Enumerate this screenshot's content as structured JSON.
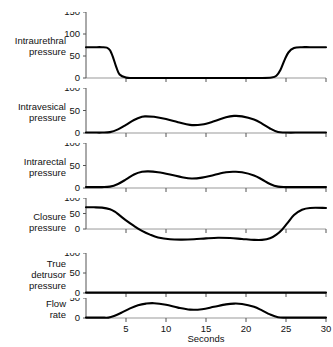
{
  "chart_data": {
    "type": "line",
    "title": "",
    "xlabel": "Seconds",
    "xlim": [
      0,
      30
    ],
    "xticks": [
      5,
      10,
      15,
      20,
      25,
      30
    ],
    "xticklabels": [
      "5",
      "10",
      "15",
      "20",
      "25",
      "30"
    ],
    "grid": false,
    "legend": "none",
    "line_color": "#000000",
    "axis_color": "#999999",
    "panels": [
      {
        "label": "Intraurethral pressure",
        "label_lines": [
          "Intraurethral",
          "pressure"
        ],
        "ylim": [
          0,
          150
        ],
        "yticks": [
          0,
          50,
          100,
          150
        ],
        "yticklabels": [
          "0",
          "50",
          "100",
          "150"
        ],
        "x": [
          0,
          1,
          2,
          2.6,
          3.0,
          3.4,
          3.8,
          4.2,
          5,
          6,
          10,
          14,
          18,
          22,
          23.2,
          23.8,
          24.3,
          24.8,
          25.3,
          26,
          27,
          28,
          30
        ],
        "y": [
          70,
          70,
          70,
          69,
          63,
          46,
          24,
          8,
          1,
          0,
          0,
          0,
          0,
          0,
          1,
          5,
          18,
          40,
          58,
          68,
          70,
          70,
          70
        ]
      },
      {
        "label": "Intravesical pressure",
        "label_lines": [
          "Intravesical",
          "pressure"
        ],
        "ylim": [
          0,
          100
        ],
        "yticks": [
          0,
          50,
          100
        ],
        "yticklabels": [
          "0",
          "50",
          "100"
        ],
        "x": [
          0,
          1,
          2,
          3,
          4,
          5,
          6,
          7,
          7.5,
          8.5,
          10,
          11.5,
          13,
          14.5,
          16,
          17.5,
          18.5,
          19.5,
          21,
          22,
          23,
          24,
          25,
          27,
          30
        ],
        "y": [
          1,
          1,
          1,
          2,
          8,
          18,
          29,
          36,
          37,
          36,
          31,
          24,
          18,
          19,
          26,
          35,
          38,
          37,
          30,
          21,
          10,
          2,
          1,
          1,
          1
        ]
      },
      {
        "label": "Intrarectal pressure",
        "label_lines": [
          "Intrarectal",
          "pressure"
        ],
        "ylim": [
          0,
          100
        ],
        "yticks": [
          0,
          50,
          100
        ],
        "yticklabels": [
          "0",
          "50",
          "100"
        ],
        "x": [
          0,
          1,
          2,
          3,
          4,
          5,
          6,
          7,
          7.8,
          9,
          10.5,
          12,
          13.2,
          14.5,
          16,
          17.5,
          18.5,
          19.5,
          21,
          22,
          23,
          24,
          25,
          27,
          30
        ],
        "y": [
          2,
          2,
          2,
          3,
          9,
          19,
          30,
          36,
          37,
          35,
          30,
          24,
          21,
          23,
          29,
          35,
          36,
          35,
          28,
          19,
          9,
          3,
          2,
          2,
          2
        ]
      },
      {
        "label": "Closure pressure",
        "label_lines": [
          "Closure",
          "pressure"
        ],
        "ylim": [
          -45,
          100
        ],
        "yticks": [
          0,
          50,
          100
        ],
        "yticklabels": [
          "0",
          "50",
          "100"
        ],
        "x": [
          0,
          1,
          2,
          3,
          3.6,
          4.2,
          5,
          6,
          7,
          8,
          9,
          10.5,
          12,
          13.5,
          15,
          16.5,
          18,
          19.5,
          21,
          22,
          23,
          23.8,
          24.5,
          25.2,
          26,
          27,
          28,
          30
        ],
        "y": [
          70,
          70,
          69,
          64,
          56,
          44,
          28,
          10,
          -6,
          -18,
          -27,
          -33,
          -34,
          -33,
          -30,
          -28,
          -29,
          -32,
          -35,
          -35,
          -30,
          -18,
          -2,
          20,
          45,
          62,
          68,
          68
        ]
      },
      {
        "label": "True detrusor pressure",
        "label_lines": [
          "True",
          "detrusor",
          "pressure"
        ],
        "ylim": [
          0,
          100
        ],
        "yticks": [
          0,
          50,
          100
        ],
        "yticklabels": [
          "0",
          "50",
          "100"
        ],
        "x": [
          0,
          5,
          10,
          15,
          20,
          25,
          30
        ],
        "y": [
          1,
          1,
          1,
          1,
          1,
          1,
          1
        ]
      },
      {
        "label": "Flow rate",
        "label_lines": [
          "Flow",
          "rate"
        ],
        "ylim": [
          0,
          50
        ],
        "yticks": [
          0,
          50
        ],
        "yticklabels": [
          "0",
          "50"
        ],
        "x": [
          0,
          1,
          2,
          2.8,
          3.5,
          4.5,
          5.5,
          6.5,
          7.5,
          8.5,
          10,
          11.5,
          13,
          14.5,
          16,
          17.5,
          18.5,
          19.5,
          21,
          22,
          23,
          24,
          25,
          27,
          30
        ],
        "y": [
          1,
          1,
          1,
          1,
          5,
          14,
          24,
          32,
          36,
          37,
          33,
          26,
          21,
          22,
          28,
          34,
          36,
          35,
          28,
          19,
          9,
          2,
          1,
          1,
          1
        ]
      }
    ]
  }
}
